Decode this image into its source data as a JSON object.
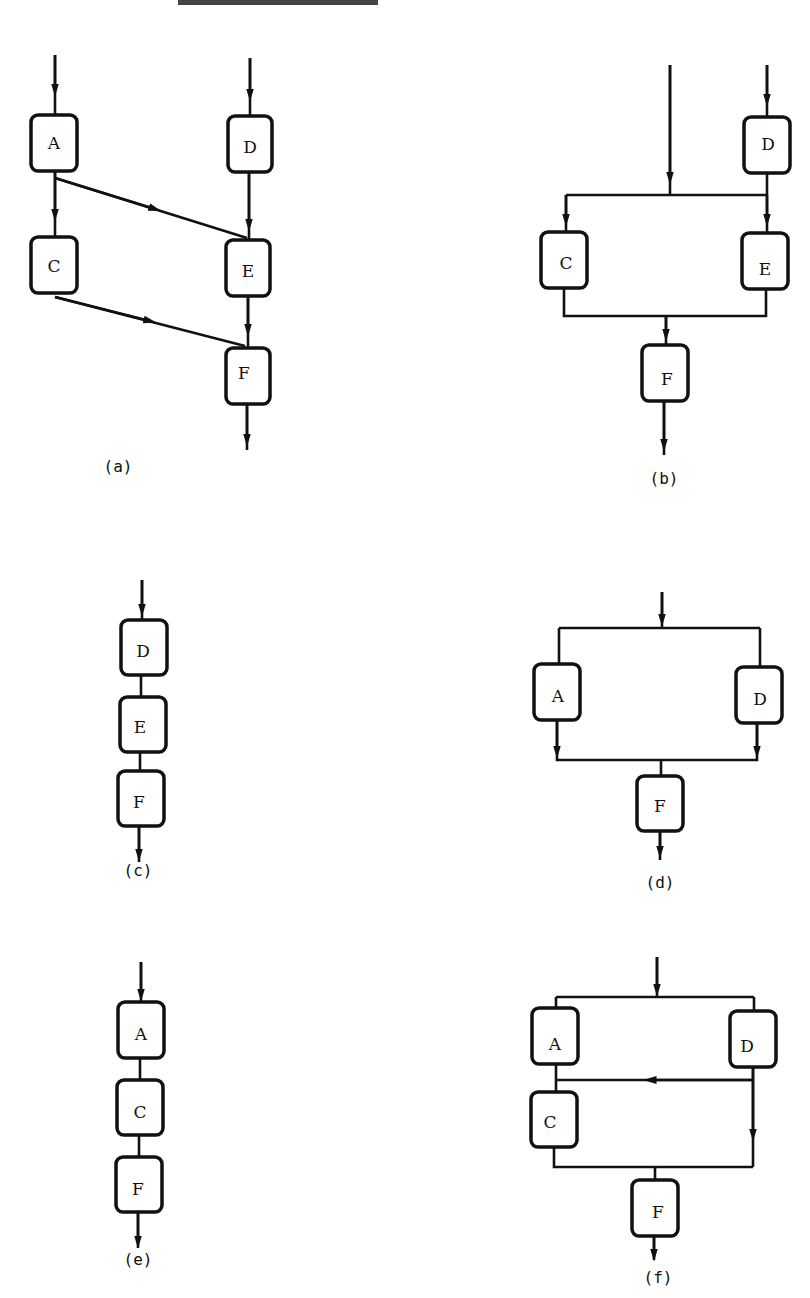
{
  "figure": {
    "panels": [
      {
        "id": "a",
        "caption": "(a)",
        "nodes": [
          "A",
          "C",
          "D",
          "E",
          "F"
        ],
        "edges": [
          [
            "in",
            "A"
          ],
          [
            "in",
            "D"
          ],
          [
            "A",
            "C"
          ],
          [
            "A",
            "E"
          ],
          [
            "D",
            "E"
          ],
          [
            "C",
            "F"
          ],
          [
            "E",
            "F"
          ],
          [
            "F",
            "out"
          ]
        ]
      },
      {
        "id": "b",
        "caption": "(b)",
        "nodes": [
          "D",
          "C",
          "E",
          "F"
        ],
        "edges": [
          [
            "in",
            "C"
          ],
          [
            "in",
            "E"
          ],
          [
            "in",
            "D"
          ],
          [
            "D",
            "E"
          ],
          [
            "D",
            "C"
          ],
          [
            "C",
            "F"
          ],
          [
            "E",
            "F"
          ],
          [
            "F",
            "out"
          ]
        ]
      },
      {
        "id": "c",
        "caption": "(c)",
        "nodes": [
          "D",
          "E",
          "F"
        ],
        "edges": [
          [
            "in",
            "D"
          ],
          [
            "D",
            "E"
          ],
          [
            "E",
            "F"
          ],
          [
            "F",
            "out"
          ]
        ]
      },
      {
        "id": "d",
        "caption": "(d)",
        "nodes": [
          "A",
          "D",
          "F"
        ],
        "edges": [
          [
            "in",
            "A"
          ],
          [
            "in",
            "D"
          ],
          [
            "A",
            "F"
          ],
          [
            "D",
            "F"
          ],
          [
            "F",
            "out"
          ]
        ]
      },
      {
        "id": "e",
        "caption": "(e)",
        "nodes": [
          "A",
          "C",
          "F"
        ],
        "edges": [
          [
            "in",
            "A"
          ],
          [
            "A",
            "C"
          ],
          [
            "C",
            "F"
          ],
          [
            "F",
            "out"
          ]
        ]
      },
      {
        "id": "f",
        "caption": "(f)",
        "nodes": [
          "A",
          "D",
          "C",
          "F"
        ],
        "edges": [
          [
            "in",
            "A"
          ],
          [
            "in",
            "D"
          ],
          [
            "A",
            "C"
          ],
          [
            "D",
            "C"
          ],
          [
            "D",
            "F"
          ],
          [
            "C",
            "F"
          ],
          [
            "F",
            "out"
          ]
        ]
      }
    ]
  },
  "labels": {
    "a": {
      "A": "A",
      "C": "C",
      "D": "D",
      "E": "E",
      "F": "F",
      "caption": "(a)"
    },
    "b": {
      "D": "D",
      "C": "C",
      "E": "E",
      "F": "F",
      "caption": "(b)"
    },
    "c": {
      "D": "D",
      "E": "E",
      "F": "F",
      "caption": "(c)"
    },
    "d": {
      "A": "A",
      "D": "D",
      "F": "F",
      "caption": "(d)"
    },
    "e": {
      "A": "A",
      "C": "C",
      "F": "F",
      "caption": "(e)"
    },
    "f": {
      "A": "A",
      "D": "D",
      "C": "C",
      "F": "F",
      "caption": "(f)"
    }
  }
}
